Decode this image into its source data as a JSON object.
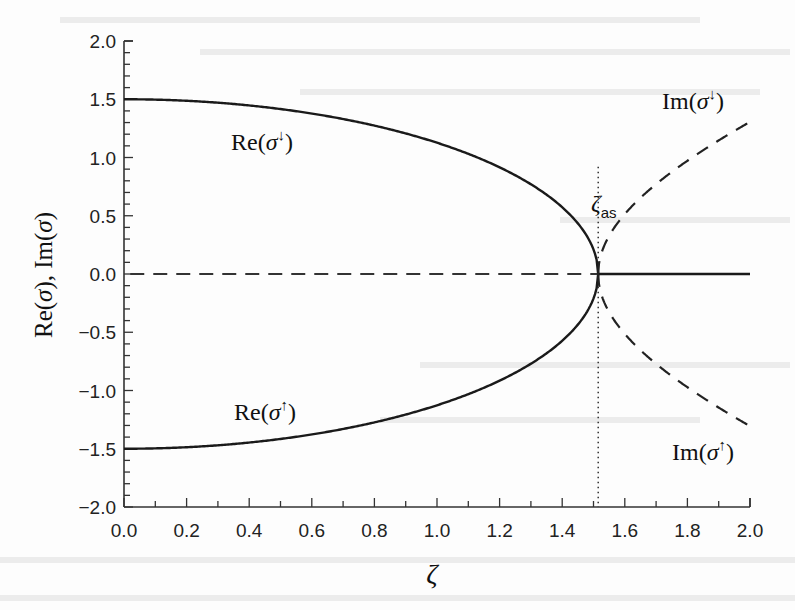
{
  "chart_data": {
    "type": "line",
    "title": "",
    "xlabel": "ζ",
    "ylabel": "Re(σ), Im(σ)",
    "xlim": [
      0.0,
      2.0
    ],
    "ylim": [
      -2.0,
      2.0
    ],
    "x_ticks": [
      "0.0",
      "0.2",
      "0.4",
      "0.6",
      "0.8",
      "1.0",
      "1.2",
      "1.4",
      "1.6",
      "1.8",
      "2.0"
    ],
    "y_ticks": [
      "2.0",
      "1.5",
      "1.0",
      "0.5",
      "0.0",
      "−0.5",
      "−1.0",
      "−1.5",
      "−2.0"
    ],
    "grid": false,
    "legend": "none (inline annotations)",
    "zeta_as": 1.515,
    "vertical_marker": {
      "x": 1.515,
      "label": "ζ",
      "subscript": "as",
      "style": "dotted"
    },
    "series": [
      {
        "name": "Re(σ↓)",
        "style": "solid",
        "x": [
          0.0,
          0.2,
          0.4,
          0.6,
          0.8,
          1.0,
          1.2,
          1.4,
          1.5,
          1.515,
          1.6,
          1.8,
          2.0
        ],
        "values": [
          1.5,
          1.49,
          1.45,
          1.38,
          1.27,
          1.13,
          0.92,
          0.57,
          0.21,
          0.0,
          0.0,
          0.0,
          0.0
        ]
      },
      {
        "name": "Re(σ↑)",
        "style": "solid",
        "x": [
          0.0,
          0.2,
          0.4,
          0.6,
          0.8,
          1.0,
          1.2,
          1.4,
          1.5,
          1.515,
          1.6,
          1.8,
          2.0
        ],
        "values": [
          -1.5,
          -1.49,
          -1.45,
          -1.38,
          -1.27,
          -1.13,
          -0.92,
          -0.57,
          -0.21,
          0.0,
          0.0,
          0.0,
          0.0
        ]
      },
      {
        "name": "Im(σ↓)",
        "style": "dashed",
        "x": [
          0.0,
          0.5,
          1.0,
          1.515,
          1.6,
          1.7,
          1.8,
          1.9,
          2.0
        ],
        "values": [
          0.0,
          0.0,
          0.0,
          0.0,
          0.51,
          0.77,
          0.97,
          1.15,
          1.31
        ]
      },
      {
        "name": "Im(σ↑)",
        "style": "dashed",
        "x": [
          0.0,
          0.5,
          1.0,
          1.515,
          1.6,
          1.7,
          1.8,
          1.9,
          2.0
        ],
        "values": [
          0.0,
          0.0,
          0.0,
          0.0,
          -0.51,
          -0.77,
          -0.97,
          -1.15,
          -1.31
        ]
      }
    ],
    "annotations": [
      {
        "text": "Re(σ↓)",
        "x": 0.62,
        "y": 1.12
      },
      {
        "text": "Re(σ↑)",
        "x": 0.62,
        "y": -1.3
      },
      {
        "text": "Im(σ↓)",
        "x": 1.9,
        "y": 1.6
      },
      {
        "text": "Im(σ↑)",
        "x": 1.93,
        "y": -1.68
      }
    ]
  },
  "labels": {
    "xlabel": "ζ",
    "ylabel": "Re(σ), Im(σ)",
    "zeta_as_main": "ζ",
    "zeta_as_sub": "as",
    "re_down": "Re(σ↓)",
    "re_up": "Re(σ↑)",
    "im_down": "Im(σ↓)",
    "im_up": "Im(σ↑)"
  }
}
